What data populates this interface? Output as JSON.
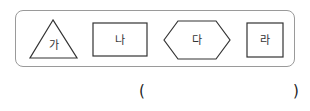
{
  "figure": {
    "shapes": [
      {
        "type": "triangle",
        "label": "가"
      },
      {
        "type": "rectangle",
        "label": "나"
      },
      {
        "type": "hexagon",
        "label": "다"
      },
      {
        "type": "square",
        "label": "라"
      }
    ]
  },
  "answer": {
    "open_paren": "(",
    "close_paren": ")",
    "value": ""
  }
}
